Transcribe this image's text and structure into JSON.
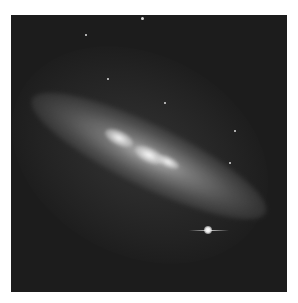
{
  "image": {
    "subject": "edge-on starburst galaxy against black sky",
    "colors": {
      "background": "#1c1c1c",
      "border": "#ffffff",
      "galaxy_core": "#e6e6e6"
    },
    "features": [
      {
        "name": "galaxy-disk",
        "orientation": "diagonal, upper-left to lower-right"
      },
      {
        "name": "bright-foreground-star",
        "position": "lower-right, with horizontal diffraction spike"
      },
      {
        "name": "faint-stars",
        "count": 6
      }
    ]
  }
}
